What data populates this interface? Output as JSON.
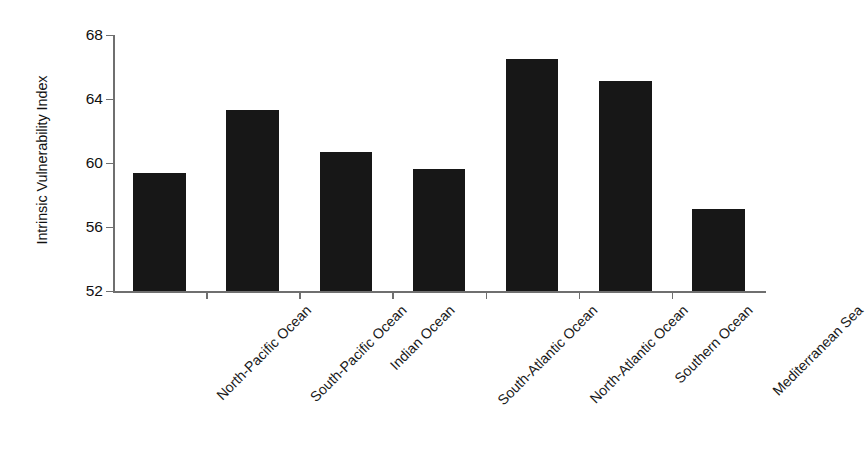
{
  "chart_data": {
    "type": "bar",
    "title": "",
    "xlabel": "",
    "ylabel": "Intrinsic Vulnerability Index",
    "categories": [
      "North-Pacific Ocean",
      "South-Pacific Ocean",
      "Indian Ocean",
      "South-Atlantic Ocean",
      "North-Atlantic Ocean",
      "Southern Ocean",
      "Mediterranean Sea"
    ],
    "values": [
      59.4,
      63.3,
      60.7,
      59.6,
      66.5,
      65.1,
      57.1
    ],
    "ylim": [
      52,
      68
    ],
    "yticks": [
      52,
      56,
      60,
      64,
      68
    ],
    "ytick_labels": [
      "52",
      "56",
      "60",
      "64",
      "68"
    ],
    "grid": false,
    "legend": false,
    "bar_color": "#171717",
    "axis_color": "#6f6f6f",
    "background_color": "#ffffff"
  }
}
